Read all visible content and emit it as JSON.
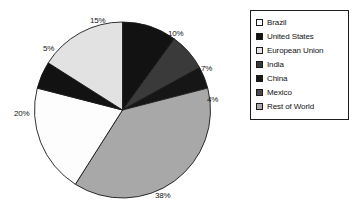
{
  "chart_data": {
    "type": "pie",
    "title": "",
    "labels": [
      "Brazil",
      "United States",
      "European Union",
      "India",
      "China",
      "Mexico",
      "Rest of World"
    ],
    "values": [
      20,
      10,
      15,
      7,
      4,
      5,
      38
    ],
    "value_labels": [
      "20%",
      "10%",
      "15%",
      "7%",
      "4%",
      "5%",
      "38%"
    ],
    "colors": [
      "#fdfdfd",
      "#121212",
      "#e2e2e2",
      "#3a3a3a",
      "#161616",
      "#4a4a4a",
      "#a8a8a8"
    ],
    "legend_position": "right",
    "grid": false,
    "slices": [
      {
        "name": "United States",
        "value": 10,
        "value_label": "10%",
        "color": "#121212",
        "start_deg": 0,
        "end_deg": 36,
        "label_x": 168,
        "label_y": 29
      },
      {
        "name": "India",
        "value": 7,
        "value_label": "7%",
        "color": "#3a3a3a",
        "start_deg": 36,
        "end_deg": 61.2,
        "label_x": 201,
        "label_y": 64
      },
      {
        "name": "China",
        "value": 4,
        "value_label": "4%",
        "color": "#161616",
        "start_deg": 61.2,
        "end_deg": 75.6,
        "label_x": 207,
        "label_y": 95
      },
      {
        "name": "Rest of World",
        "value": 38,
        "value_label": "38%",
        "color": "#a8a8a8",
        "start_deg": 75.6,
        "end_deg": 212.4,
        "label_x": 155,
        "label_y": 191
      },
      {
        "name": "Brazil",
        "value": 20,
        "value_label": "20%",
        "color": "#fdfdfd",
        "start_deg": 212.4,
        "end_deg": 284.4,
        "label_x": 14,
        "label_y": 109
      },
      {
        "name": "Mexico",
        "value": 5,
        "value_label": "5%",
        "color": "#121212",
        "start_deg": 284.4,
        "end_deg": 302.4,
        "label_x": 43,
        "label_y": 44
      },
      {
        "name": "European Union",
        "value": 15,
        "value_label": "15%",
        "color": "#e2e2e2",
        "start_deg": 302.4,
        "end_deg": 360,
        "label_x": 90,
        "label_y": 16
      }
    ],
    "legend_entries": [
      {
        "label": "Brazil",
        "color": "#fdfdfd"
      },
      {
        "label": "United States",
        "color": "#121212"
      },
      {
        "label": "European Union",
        "color": "#e2e2e2"
      },
      {
        "label": "India",
        "color": "#3a3a3a"
      },
      {
        "label": "China",
        "color": "#161616"
      },
      {
        "label": "Mexico",
        "color": "#4a4a4a"
      },
      {
        "label": "Rest of World",
        "color": "#a8a8a8"
      }
    ]
  }
}
